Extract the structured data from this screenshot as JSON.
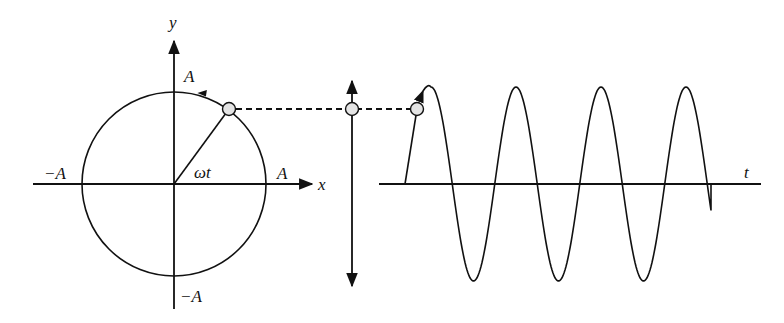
{
  "figure": {
    "colors": {
      "line": "#111111",
      "ball_fill": "#e4e4e4",
      "background": "#ffffff"
    }
  },
  "circle_panel": {
    "labels": {
      "y_axis": "y",
      "x_axis": "x",
      "top": "A",
      "right": "A",
      "left": "−A",
      "bottom": "−A",
      "angle": "ωt"
    },
    "center": [
      174,
      184
    ],
    "radius": 92,
    "ball": [
      229,
      109
    ],
    "direction": "counterclockwise"
  },
  "projection_panel": {
    "ball": [
      352,
      109
    ],
    "arrow": "double-headed-vertical"
  },
  "wave_panel": {
    "labels": {
      "t_axis": "t"
    },
    "ball": [
      417,
      109
    ],
    "axis_y": 184,
    "amplitude_px": 97,
    "start_x": 405,
    "end_x": 711,
    "peaks_x": [
      431,
      516,
      600,
      686
    ],
    "troughs_x": [
      475,
      557,
      641
    ]
  }
}
